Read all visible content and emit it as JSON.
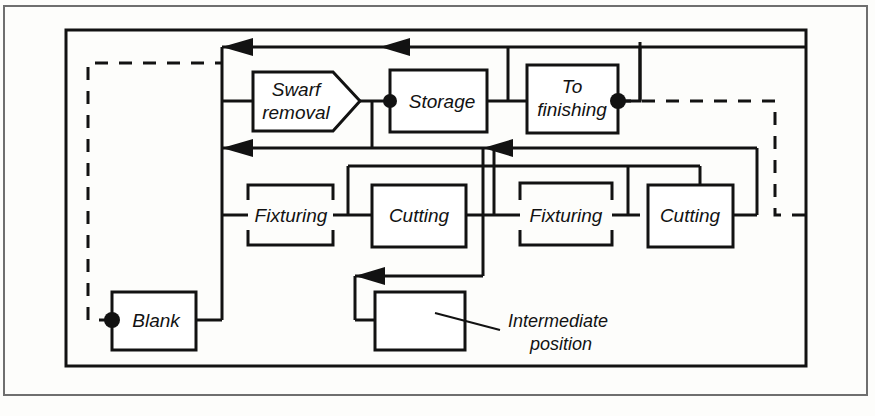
{
  "figure": {
    "kind": "process-flow-diagram",
    "title": "",
    "background_color": "#fdfdfb",
    "line_color": "#121212",
    "fill_color": "#ffffff"
  },
  "nodes": {
    "swarf_removal": {
      "label_line1": "Swarf",
      "label_line2": "removal",
      "shape": "pentagon-arrow"
    },
    "storage": {
      "label": "Storage",
      "shape": "rectangle"
    },
    "to_finishing": {
      "label_line1": "To",
      "label_line2": "finishing",
      "shape": "rectangle"
    },
    "fixturing_1": {
      "label": "Fixturing",
      "shape": "broken-rectangle"
    },
    "cutting_1": {
      "label": "Cutting",
      "shape": "rectangle"
    },
    "fixturing_2": {
      "label": "Fixturing",
      "shape": "broken-rectangle"
    },
    "cutting_2": {
      "label": "Cutting",
      "shape": "rectangle"
    },
    "blank": {
      "label": "Blank",
      "shape": "rectangle"
    },
    "intermediate": {
      "label": "",
      "shape": "rectangle"
    }
  },
  "callouts": {
    "intermediate_position": {
      "line1": "Intermediate",
      "line2": "position"
    }
  },
  "junction_dots": [
    {
      "at": "storage-left",
      "x": 390,
      "y": 101
    },
    {
      "at": "to-finishing-right",
      "x": 618,
      "y": 101
    },
    {
      "at": "blank-left",
      "x": 112,
      "y": 320
    }
  ],
  "legend": {
    "solid_line": "workpiece transfer path",
    "dashed_line": "return / pallet recirculation path"
  }
}
